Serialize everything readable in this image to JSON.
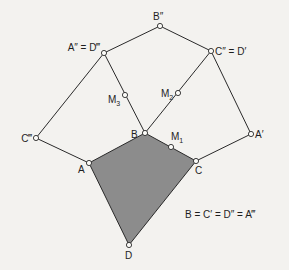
{
  "diagram": {
    "title": "",
    "colors": {
      "background": "#f3f2ef",
      "shaded_quad": "#8c8c8c",
      "line": "#2a2a2a"
    },
    "points": [
      {
        "id": "Bpp",
        "label": "B″",
        "x": 160,
        "y": 26
      },
      {
        "id": "App",
        "label": "A″ = D‴",
        "x": 104,
        "y": 53
      },
      {
        "id": "Cpp",
        "label": "C″ = D′",
        "x": 211,
        "y": 51
      },
      {
        "id": "M3",
        "label": "M",
        "sub": "3",
        "x": 125,
        "y": 95
      },
      {
        "id": "M2",
        "label": "M",
        "sub": "2",
        "x": 178,
        "y": 93
      },
      {
        "id": "B",
        "label": "B",
        "x": 145,
        "y": 133
      },
      {
        "id": "M1",
        "label": "M",
        "sub": "1",
        "x": 171,
        "y": 147
      },
      {
        "id": "C",
        "label": "C",
        "x": 196,
        "y": 161
      },
      {
        "id": "Ap",
        "label": "A′",
        "x": 251,
        "y": 134
      },
      {
        "id": "Cppp",
        "label": "C‴",
        "x": 36,
        "y": 138
      },
      {
        "id": "A",
        "label": "A",
        "x": 89,
        "y": 163
      },
      {
        "id": "D",
        "label": "D",
        "x": 129,
        "y": 245
      }
    ],
    "labels": {
      "Bpp": "B″",
      "App": "A″ = D‴",
      "Cpp": "C″ = D′",
      "M": "M",
      "M1_sub": "1",
      "M2_sub": "2",
      "M3_sub": "3",
      "B": "B",
      "C": "C",
      "Ap": "A′",
      "Cppp": "C‴",
      "A": "A",
      "D": "D",
      "equation": "B = C′ = D″ = A‴"
    },
    "edges": [
      [
        "App",
        "Bpp"
      ],
      [
        "Bpp",
        "Cpp"
      ],
      [
        "App",
        "M3"
      ],
      [
        "M3",
        "B"
      ],
      [
        "Cpp",
        "M2"
      ],
      [
        "M2",
        "B"
      ],
      [
        "App",
        "Cppp"
      ],
      [
        "Cppp",
        "A"
      ],
      [
        "Cpp",
        "Ap"
      ],
      [
        "Ap",
        "C"
      ],
      [
        "A",
        "B"
      ],
      [
        "B",
        "M1"
      ],
      [
        "M1",
        "C"
      ],
      [
        "C",
        "D"
      ],
      [
        "D",
        "A"
      ]
    ],
    "shaded_polygon": [
      "A",
      "B",
      "C",
      "D"
    ]
  }
}
